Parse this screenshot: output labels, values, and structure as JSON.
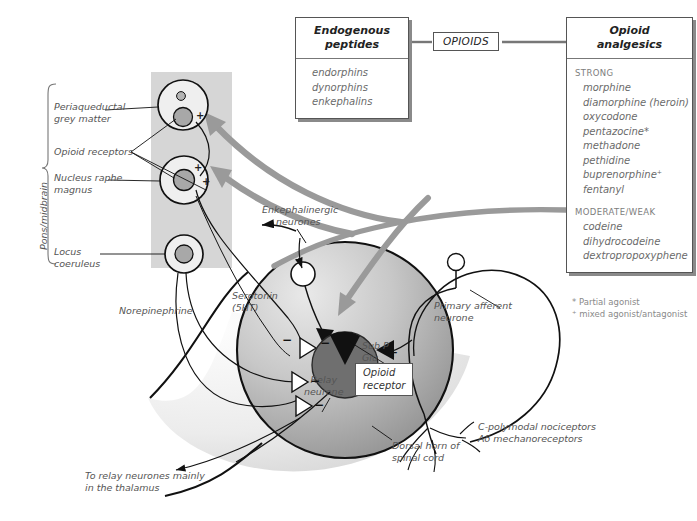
{
  "boxes": {
    "endogenous": {
      "heading_line1": "Endogenous",
      "heading_line2": "peptides",
      "items": [
        "endorphins",
        "dynorphins",
        "enkephalins"
      ]
    },
    "opioids_tag": "OPIOIDS",
    "analgesics": {
      "heading_line1": "Opioid",
      "heading_line2": "analgesics",
      "groups": [
        {
          "label": "STRONG",
          "items": [
            "morphine",
            "diamorphine (heroin)",
            "oxycodone",
            "pentazocine*",
            "methadone",
            "pethidine",
            "buprenorphine⁺",
            "fentanyl"
          ]
        },
        {
          "label": "MODERATE/WEAK",
          "items": [
            "codeine",
            "dihydrocodeine",
            "dextropropoxyphene"
          ]
        }
      ],
      "footnotes": [
        "* Partial agonist",
        "⁺ mixed agonist/antagonist"
      ]
    }
  },
  "brain": {
    "region_bracket": "Pons/midbrain",
    "nuclei": [
      {
        "name": "periaqueductal-grey-matter",
        "label_line1": "Periaqueductal",
        "label_line2": "grey matter"
      },
      {
        "name": "nucleus-raphe-magnus",
        "label_line1": "Nucleus raphe",
        "label_line2": "magnus"
      },
      {
        "name": "locus-coeruleus",
        "label_line1": "Locus",
        "label_line2": "coeruleus"
      }
    ],
    "receptors_label": "Opioid receptors",
    "plus_signs": [
      "+",
      "+",
      "+"
    ]
  },
  "cord": {
    "dorsal_horn_line1": "Dorsal horn of",
    "dorsal_horn_line2": "spinal cord",
    "enkephalinergic_line1": "Enkephalinergic",
    "enkephalinergic_line2": "neurones",
    "serotonin_line1": "Serotonin",
    "serotonin_line2": "(5HT)",
    "norepinephrine": "Norepinephrine",
    "primary_afferent_line1": "Primary afferent",
    "primary_afferent_line2": "neurone",
    "relay_line1": "Relay",
    "relay_line2": "neurone",
    "transmitters_line1": "Sub P",
    "transmitters_line2": "Glu",
    "opioid_receptor_line1": "Opioid",
    "opioid_receptor_line2": "receptor",
    "output_line1": "To relay neurones mainly",
    "output_line2": "in the thalamus",
    "afferent_types_line1": "C-polymodal nociceptors",
    "afferent_types_line2": "Aδ mechanoreceptors",
    "signs": {
      "minus": "−",
      "plus": "+"
    }
  },
  "colors": {
    "band_gray": "#d6d6d6",
    "arrow_gray": "#9a9a9a",
    "nucleus_fill": "#a8a8a8",
    "relay_fill": "#6f6f6f",
    "ink": "#111111",
    "label_gray": "#555555"
  }
}
